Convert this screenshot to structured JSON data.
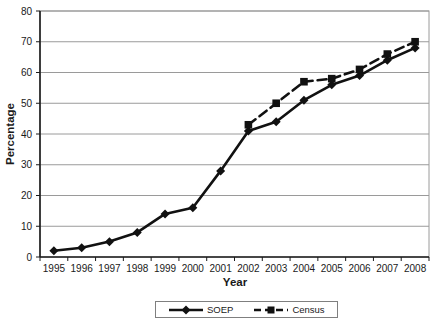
{
  "chart_data": {
    "type": "line",
    "title": "",
    "xlabel": "Year",
    "ylabel": "Percentage",
    "ylim": [
      0,
      80
    ],
    "ytick_step": 10,
    "grid": true,
    "legend_position": "bottom-center",
    "categories": [
      "1995",
      "1996",
      "1997",
      "1998",
      "1999",
      "2000",
      "2001",
      "2002",
      "2003",
      "2004",
      "2005",
      "2006",
      "2007",
      "2008"
    ],
    "series": [
      {
        "name": "SOEP",
        "marker": "diamond",
        "line_style": "solid",
        "color": "#111111",
        "values": [
          2,
          3,
          5,
          8,
          14,
          16,
          28,
          41,
          44,
          51,
          56,
          59,
          64,
          68
        ]
      },
      {
        "name": "Census",
        "marker": "square",
        "line_style": "dashed",
        "color": "#111111",
        "values": [
          null,
          null,
          null,
          null,
          null,
          null,
          null,
          43,
          50,
          57,
          58,
          61,
          66,
          70
        ]
      }
    ]
  }
}
